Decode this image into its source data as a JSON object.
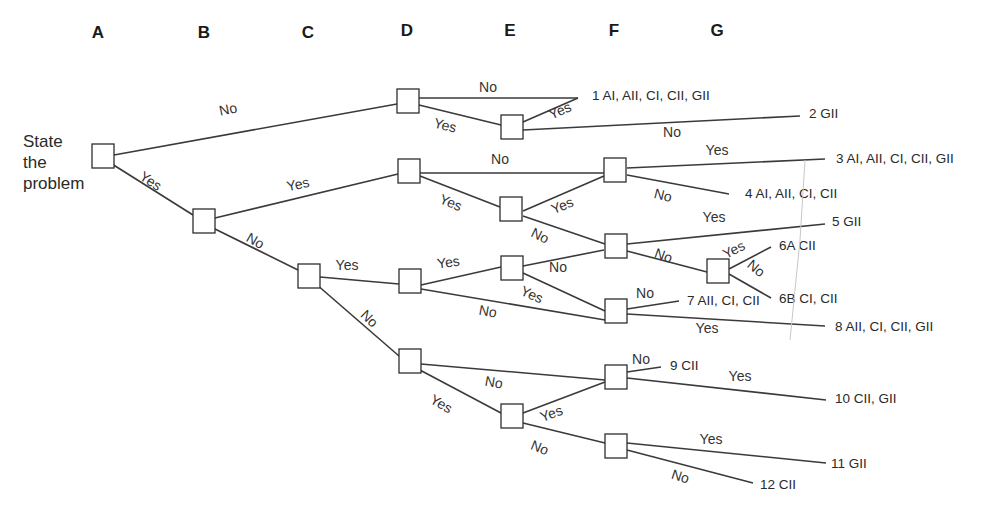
{
  "columns": [
    {
      "label": "A",
      "x": 98,
      "y": 38
    },
    {
      "label": "B",
      "x": 204,
      "y": 38
    },
    {
      "label": "C",
      "x": 308,
      "y": 38
    },
    {
      "label": "D",
      "x": 407,
      "y": 36
    },
    {
      "label": "E",
      "x": 510,
      "y": 36
    },
    {
      "label": "F",
      "x": 614,
      "y": 36
    },
    {
      "label": "G",
      "x": 717,
      "y": 36
    }
  ],
  "start": {
    "lines": [
      "State",
      "the",
      "problem"
    ],
    "x": 23,
    "y": 147
  },
  "nodes": [
    {
      "id": "A",
      "x": 103,
      "y": 156
    },
    {
      "id": "B",
      "x": 204,
      "y": 221
    },
    {
      "id": "C",
      "x": 309,
      "y": 276
    },
    {
      "id": "D1",
      "x": 408,
      "y": 101
    },
    {
      "id": "D2",
      "x": 409,
      "y": 171
    },
    {
      "id": "D3",
      "x": 410,
      "y": 281
    },
    {
      "id": "D4",
      "x": 410,
      "y": 361
    },
    {
      "id": "E1",
      "x": 512,
      "y": 127
    },
    {
      "id": "E2",
      "x": 511,
      "y": 209
    },
    {
      "id": "E3",
      "x": 512,
      "y": 268
    },
    {
      "id": "E4",
      "x": 512,
      "y": 416
    },
    {
      "id": "F1",
      "x": 615,
      "y": 170
    },
    {
      "id": "F2",
      "x": 616,
      "y": 246
    },
    {
      "id": "F3",
      "x": 616,
      "y": 311
    },
    {
      "id": "F4",
      "x": 616,
      "y": 377
    },
    {
      "id": "F5",
      "x": 616,
      "y": 446
    },
    {
      "id": "G1",
      "x": 718,
      "y": 271
    }
  ],
  "edges": [
    {
      "from": [
        114,
        155
      ],
      "to": [
        397,
        104
      ],
      "label": "No",
      "lx": 229,
      "ly": 114,
      "rot": -12
    },
    {
      "from": [
        112,
        164
      ],
      "to": [
        193,
        215
      ],
      "label": "Yes",
      "lx": 148,
      "ly": 185,
      "rot": 33
    },
    {
      "from": [
        419,
        98
      ],
      "to": [
        578,
        98
      ],
      "label": "No",
      "lx": 488,
      "ly": 92,
      "rot": 0
    },
    {
      "from": [
        419,
        105
      ],
      "to": [
        501,
        125
      ],
      "label": "Yes",
      "lx": 444,
      "ly": 130,
      "rot": 14
    },
    {
      "from": [
        523,
        122
      ],
      "to": [
        578,
        98
      ],
      "label": "Yes",
      "lx": 562,
      "ly": 115,
      "rot": -24
    },
    {
      "from": [
        523,
        130
      ],
      "to": [
        800,
        116
      ],
      "label": "No",
      "lx": 672,
      "ly": 137,
      "rot": 0
    },
    {
      "from": [
        215,
        218
      ],
      "to": [
        398,
        174
      ],
      "label": "Yes",
      "lx": 299,
      "ly": 189,
      "rot": -12
    },
    {
      "from": [
        213,
        228
      ],
      "to": [
        298,
        270
      ],
      "label": "No",
      "lx": 253,
      "ly": 245,
      "rot": 30
    },
    {
      "from": [
        420,
        173
      ],
      "to": [
        604,
        173
      ],
      "label": "No",
      "lx": 500,
      "ly": 164,
      "rot": 0
    },
    {
      "from": [
        420,
        176
      ],
      "to": [
        500,
        207
      ],
      "label": "Yes",
      "lx": 449,
      "ly": 207,
      "rot": 22
    },
    {
      "from": [
        523,
        211
      ],
      "to": [
        604,
        176
      ],
      "label": "Yes",
      "lx": 564,
      "ly": 210,
      "rot": -22
    },
    {
      "from": [
        523,
        216
      ],
      "to": [
        605,
        244
      ],
      "label": "No",
      "lx": 538,
      "ly": 240,
      "rot": 26
    },
    {
      "from": [
        627,
        168
      ],
      "to": [
        825,
        159
      ],
      "label": "Yes",
      "lx": 717,
      "ly": 155,
      "rot": 0
    },
    {
      "from": [
        627,
        175
      ],
      "to": [
        729,
        194
      ],
      "label": "No",
      "lx": 662,
      "ly": 200,
      "rot": 14
    },
    {
      "from": [
        320,
        277
      ],
      "to": [
        399,
        284
      ],
      "label": "Yes",
      "lx": 347,
      "ly": 270,
      "rot": 0
    },
    {
      "from": [
        316,
        284
      ],
      "to": [
        399,
        356
      ],
      "label": "No",
      "lx": 366,
      "ly": 322,
      "rot": 45
    },
    {
      "from": [
        421,
        285
      ],
      "to": [
        501,
        267
      ],
      "label": "Yes",
      "lx": 449,
      "ly": 267,
      "rot": -8
    },
    {
      "from": [
        421,
        289
      ],
      "to": [
        605,
        320
      ],
      "label": "No",
      "lx": 487,
      "ly": 316,
      "rot": 10
    },
    {
      "from": [
        523,
        266
      ],
      "to": [
        604,
        250
      ],
      "label": "No",
      "lx": 558,
      "ly": 272,
      "rot": 0
    },
    {
      "from": [
        523,
        273
      ],
      "to": [
        605,
        311
      ],
      "label": "Yes",
      "lx": 530,
      "ly": 299,
      "rot": 24
    },
    {
      "from": [
        627,
        244
      ],
      "to": [
        825,
        224
      ],
      "label": "Yes",
      "lx": 714,
      "ly": 222,
      "rot": 0
    },
    {
      "from": [
        627,
        251
      ],
      "to": [
        707,
        272
      ],
      "label": "No",
      "lx": 662,
      "ly": 260,
      "rot": 20
    },
    {
      "from": [
        729,
        269
      ],
      "to": [
        771,
        247
      ],
      "label": "Yes",
      "lx": 736,
      "ly": 254,
      "rot": -28
    },
    {
      "from": [
        729,
        274
      ],
      "to": [
        771,
        298
      ],
      "label": "No",
      "lx": 753,
      "ly": 272,
      "rot": 40
    },
    {
      "from": [
        627,
        309
      ],
      "to": [
        679,
        301
      ],
      "label": "No",
      "lx": 645,
      "ly": 298,
      "rot": 0
    },
    {
      "from": [
        627,
        314
      ],
      "to": [
        825,
        326
      ],
      "label": "Yes",
      "lx": 707,
      "ly": 333,
      "rot": 0
    },
    {
      "from": [
        421,
        364
      ],
      "to": [
        605,
        380
      ],
      "label": "No",
      "lx": 493,
      "ly": 387,
      "rot": 10
    },
    {
      "from": [
        418,
        369
      ],
      "to": [
        501,
        413
      ],
      "label": "Yes",
      "lx": 439,
      "ly": 408,
      "rot": 30
    },
    {
      "from": [
        523,
        413
      ],
      "to": [
        605,
        382
      ],
      "label": "Yes",
      "lx": 553,
      "ly": 418,
      "rot": -20
    },
    {
      "from": [
        523,
        423
      ],
      "to": [
        605,
        443
      ],
      "label": "No",
      "lx": 538,
      "ly": 452,
      "rot": 22
    },
    {
      "from": [
        627,
        372
      ],
      "to": [
        661,
        367
      ],
      "label": "No",
      "lx": 641,
      "ly": 364,
      "rot": 0
    },
    {
      "from": [
        627,
        378
      ],
      "to": [
        826,
        400
      ],
      "label": "Yes",
      "lx": 740,
      "ly": 381,
      "rot": 0
    },
    {
      "from": [
        627,
        443
      ],
      "to": [
        826,
        463
      ],
      "label": "Yes",
      "lx": 711,
      "ly": 444,
      "rot": 0
    },
    {
      "from": [
        627,
        450
      ],
      "to": [
        753,
        483
      ],
      "label": "No",
      "lx": 679,
      "ly": 481,
      "rot": 18
    }
  ],
  "outcomes": [
    {
      "id": "1",
      "text": "1 AI, AII, CI, CII, GII",
      "x": 592,
      "y": 100
    },
    {
      "id": "2",
      "text": "2 GII",
      "x": 809,
      "y": 118
    },
    {
      "id": "3",
      "text": "3 AI, AII, CI, CII, GII",
      "x": 836,
      "y": 163
    },
    {
      "id": "4",
      "text": "4 AI, AII, CI, CII",
      "x": 745,
      "y": 198
    },
    {
      "id": "5",
      "text": "5 GII",
      "x": 832,
      "y": 226
    },
    {
      "id": "6A",
      "text": "6A CII",
      "x": 779,
      "y": 250
    },
    {
      "id": "6B",
      "text": "6B CI, CII",
      "x": 779,
      "y": 303
    },
    {
      "id": "7",
      "text": "7 AII, CI, CII",
      "x": 687,
      "y": 305
    },
    {
      "id": "8",
      "text": "8 AII, CI, CII, GII",
      "x": 835,
      "y": 331
    },
    {
      "id": "9",
      "text": "9 CII",
      "x": 670,
      "y": 370
    },
    {
      "id": "10",
      "text": "10 CII, GII",
      "x": 835,
      "y": 403
    },
    {
      "id": "11",
      "text": "11 GII",
      "x": 831,
      "y": 468
    },
    {
      "id": "12",
      "text": "12 CII",
      "x": 760,
      "y": 489
    }
  ]
}
